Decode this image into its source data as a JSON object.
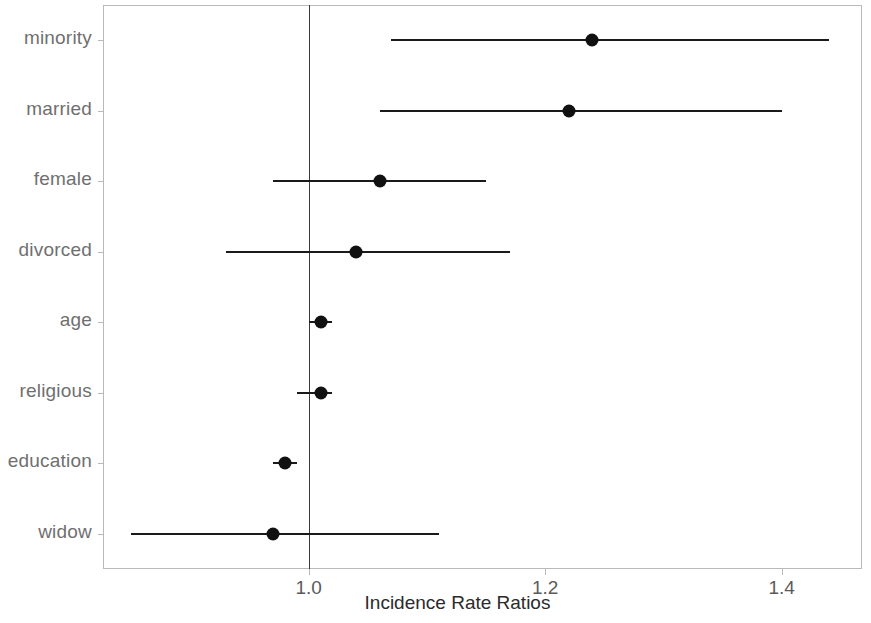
{
  "chart_data": {
    "type": "scatter",
    "chart_subtype": "forest-plot",
    "title": "",
    "xlabel": "Incidence Rate Ratios",
    "ylabel": "",
    "xlim": [
      0.826,
      1.468
    ],
    "xticks": [
      1.0,
      1.2,
      1.4
    ],
    "xticklabels": [
      "1.0",
      "1.2",
      "1.4"
    ],
    "grid": false,
    "legend": null,
    "reference_line": 1.0,
    "categories": [
      "minority",
      "married",
      "female",
      "divorced",
      "age",
      "religious",
      "education",
      "widow"
    ],
    "values": [
      1.24,
      1.22,
      1.06,
      1.04,
      1.01,
      1.01,
      0.98,
      0.97
    ],
    "ci_low": [
      1.07,
      1.06,
      0.97,
      0.93,
      1.0,
      0.99,
      0.97,
      0.85
    ],
    "ci_high": [
      1.44,
      1.4,
      1.15,
      1.17,
      1.02,
      1.02,
      0.99,
      1.11
    ],
    "points": [
      {
        "label": "minority",
        "estimate": 1.24,
        "ci_low": 1.07,
        "ci_high": 1.44
      },
      {
        "label": "married",
        "estimate": 1.22,
        "ci_low": 1.06,
        "ci_high": 1.4
      },
      {
        "label": "female",
        "estimate": 1.06,
        "ci_low": 0.97,
        "ci_high": 1.15
      },
      {
        "label": "divorced",
        "estimate": 1.04,
        "ci_low": 0.93,
        "ci_high": 1.17
      },
      {
        "label": "age",
        "estimate": 1.01,
        "ci_low": 1.0,
        "ci_high": 1.02
      },
      {
        "label": "religious",
        "estimate": 1.01,
        "ci_low": 0.99,
        "ci_high": 1.02
      },
      {
        "label": "education",
        "estimate": 0.98,
        "ci_low": 0.97,
        "ci_high": 0.99
      },
      {
        "label": "widow",
        "estimate": 0.97,
        "ci_low": 0.85,
        "ci_high": 1.11
      }
    ],
    "colors": {
      "point": "#111111",
      "interval": "#1a1a1a",
      "reference_line": "#3a3a3a",
      "panel_border": "#b9b9b9",
      "axis_text": "#5a5a5a",
      "category_text": "#6f6f6f",
      "background": "#ffffff"
    }
  }
}
